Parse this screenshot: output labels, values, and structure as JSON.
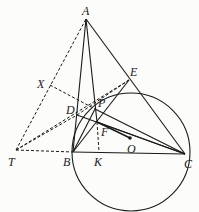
{
  "diagram": {
    "type": "geometry",
    "points": {
      "A": {
        "label": "A",
        "x": 86,
        "y": 19
      },
      "E": {
        "label": "E",
        "x": 129,
        "y": 80
      },
      "X": {
        "label": "X",
        "x": 50,
        "y": 85
      },
      "D": {
        "label": "D",
        "x": 77,
        "y": 115
      },
      "P": {
        "label": "P",
        "x": 95,
        "y": 109
      },
      "F": {
        "label": "F",
        "x": 97,
        "y": 122
      },
      "O": {
        "label": "O",
        "x": 130,
        "y": 138
      },
      "T": {
        "label": "T",
        "x": 16,
        "y": 150
      },
      "B": {
        "label": "B",
        "x": 73,
        "y": 152
      },
      "K": {
        "label": "K",
        "x": 99,
        "y": 152
      },
      "C": {
        "label": "C",
        "x": 185,
        "y": 154
      }
    },
    "circle": {
      "cx": 131,
      "cy": 152,
      "r": 59
    },
    "solid_segments": [
      [
        "A",
        "B"
      ],
      [
        "A",
        "C"
      ],
      [
        "A",
        "F"
      ],
      [
        "B",
        "C"
      ],
      [
        "B",
        "E"
      ],
      [
        "D",
        "C"
      ],
      [
        "F",
        "C"
      ],
      [
        "B",
        "P"
      ],
      [
        "F",
        "O"
      ],
      [
        "E",
        "C"
      ]
    ],
    "dashed_segments": [
      [
        "T",
        "A"
      ],
      [
        "T",
        "B"
      ],
      [
        "T",
        "D"
      ],
      [
        "T",
        "E"
      ],
      [
        "X",
        "P"
      ],
      [
        "F",
        "K"
      ],
      [
        "D",
        "E"
      ]
    ],
    "colors": {
      "ink": "#1a1a1a",
      "paper": "#fcfcfa"
    }
  }
}
